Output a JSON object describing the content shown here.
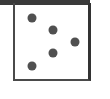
{
  "diagram": {
    "frame_color": "#3a3a3a",
    "dot_color": "#505050",
    "dots": [
      {
        "x": 32,
        "y": 18
      },
      {
        "x": 53,
        "y": 30
      },
      {
        "x": 75,
        "y": 42
      },
      {
        "x": 53,
        "y": 53
      },
      {
        "x": 32,
        "y": 66
      }
    ]
  }
}
